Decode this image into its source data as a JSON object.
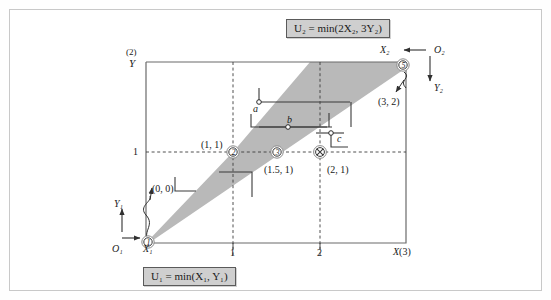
{
  "figure": {
    "type": "edgeworth-box",
    "title_top_equation": "U₂ = min(2X₂, 3Y₂)",
    "title_bottom_equation": "U₁ = min(X₁, Y₁)",
    "box": {
      "width_label": "X(3)",
      "height_label": "Y",
      "height_super": "(2)"
    }
  },
  "axes": {
    "origin1": {
      "label": "O₁",
      "x_axis": "X₁",
      "y_axis": "Y₁"
    },
    "origin2": {
      "label": "O₂",
      "x_axis": "X₂",
      "y_axis": "Y₂"
    },
    "x_ticks": [
      "1",
      "2"
    ],
    "y_ticks": [
      "1"
    ],
    "x_end_label": "X(3)",
    "y_end_label": "Y",
    "y_end_super": "(2)"
  },
  "points": [
    {
      "id": "1",
      "marker": "circled-number",
      "coord_label": "(0, 0)",
      "x": 0,
      "y": 0
    },
    {
      "id": "2",
      "marker": "circled-number",
      "coord_label": "(1, 1)",
      "x": 1,
      "y": 1
    },
    {
      "id": "3",
      "marker": "circled-number",
      "coord_label": "(1.5, 1)",
      "x": 1.5,
      "y": 1
    },
    {
      "id": "4",
      "marker": "circled-crossed",
      "coord_label": "(2, 1)",
      "x": 2,
      "y": 1
    },
    {
      "id": "5",
      "marker": "circled-number",
      "coord_label": "(3, 2)",
      "x": 3,
      "y": 2
    }
  ],
  "curve_points": [
    {
      "id": "a",
      "label": "a"
    },
    {
      "id": "b",
      "label": "b"
    },
    {
      "id": "c",
      "label": "c"
    }
  ],
  "region": {
    "name": "contract-curve-core",
    "fill": "#b5b5b5",
    "description": "shaded cone from O₁ spanning between the two rays"
  },
  "colors": {
    "shade": "#b5b5b5",
    "box_line": "#6b6b6b",
    "dashed": "#4a4a4a",
    "eq_box_bg": "#cfcfcf",
    "frame": "#c8c8c8"
  }
}
